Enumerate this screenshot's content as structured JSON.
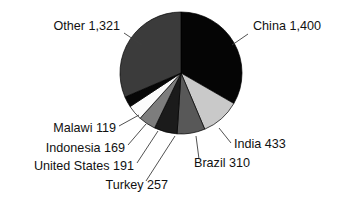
{
  "chart_data": {
    "type": "pie",
    "title": "",
    "subtitle": "",
    "xlabel": "",
    "ylabel": "",
    "legend_position": "none",
    "grid": false,
    "total": 4200,
    "units": "",
    "start_angle_deg": 0,
    "direction": "clockwise",
    "categories": [
      "China",
      "India",
      "Brazil",
      "Turkey",
      "United States",
      "Indonesia",
      "Malawi",
      "Other"
    ],
    "values": [
      1400,
      433,
      310,
      257,
      191,
      169,
      119,
      1321
    ],
    "value_labels": [
      "1,400",
      "433",
      "310",
      "257",
      "191",
      "169",
      "119",
      "1,321"
    ],
    "slices": [
      {
        "name": "China",
        "value": 1400,
        "value_label": "1,400",
        "label": "China 1,400",
        "color": "#050505",
        "start_deg": 0.0,
        "end_deg": 120.0,
        "label_x": 253,
        "label_y": 30,
        "label_anchor": "start",
        "leader_from_x": 248,
        "leader_from_y": 34,
        "leader_to_x": 232,
        "leader_to_y": 45
      },
      {
        "name": "India",
        "value": 433,
        "value_label": "433",
        "label": "India 433",
        "color": "#c9c9c9",
        "start_deg": 120.0,
        "end_deg": 157.1,
        "label_x": 234,
        "label_y": 148,
        "label_anchor": "start",
        "leader_from_x": 231,
        "leader_from_y": 143,
        "leader_to_x": 219,
        "leader_to_y": 128
      },
      {
        "name": "Brazil",
        "value": 310,
        "value_label": "310",
        "label": "Brazil 310",
        "color": "#585858",
        "start_deg": 157.1,
        "end_deg": 183.7,
        "label_x": 194,
        "label_y": 167,
        "label_anchor": "start",
        "leader_from_x": 199,
        "leader_from_y": 159,
        "leader_to_x": 196,
        "leader_to_y": 136
      },
      {
        "name": "Turkey",
        "value": 257,
        "value_label": "257",
        "label": "Turkey 257",
        "color": "#1b1b1b",
        "label_x": 168,
        "label_y": 189,
        "label_anchor": "end",
        "start_deg": 183.7,
        "end_deg": 205.7,
        "leader_from_x": 146,
        "leader_from_y": 181,
        "leader_to_x": 175,
        "leader_to_y": 136
      },
      {
        "name": "United States",
        "value": 191,
        "value_label": "191",
        "label": "United States 191",
        "color": "#7d7d7d",
        "start_deg": 205.7,
        "end_deg": 222.1,
        "label_x": 134,
        "label_y": 170,
        "label_anchor": "end",
        "leader_from_x": 137,
        "leader_from_y": 163,
        "leader_to_x": 158,
        "leader_to_y": 131
      },
      {
        "name": "Indonesia",
        "value": 169,
        "value_label": "169",
        "label": "Indonesia 169",
        "color": "#fbfbfb",
        "start_deg": 222.1,
        "end_deg": 236.6,
        "label_x": 125,
        "label_y": 152,
        "label_anchor": "end",
        "leader_from_x": 128,
        "leader_from_y": 145,
        "leader_to_x": 146,
        "leader_to_y": 124
      },
      {
        "name": "Malawi",
        "value": 119,
        "value_label": "119",
        "label": "Malawi 119",
        "color": "#070707",
        "start_deg": 236.6,
        "end_deg": 246.8,
        "label_x": 116,
        "label_y": 132,
        "label_anchor": "end",
        "leader_from_x": 119,
        "leader_from_y": 126,
        "leader_to_x": 139,
        "leader_to_y": 115
      },
      {
        "name": "Other",
        "value": 1321,
        "value_label": "1,321",
        "label": "Other 1,321",
        "color": "#3b3b3b",
        "start_deg": 246.8,
        "end_deg": 360.0,
        "label_x": 120,
        "label_y": 30,
        "label_anchor": "end",
        "leader_from_x": 124,
        "leader_from_y": 33,
        "leader_to_x": 142,
        "leader_to_y": 45
      }
    ],
    "geometry": {
      "center_x": 181,
      "center_y": 73,
      "radius": 61
    }
  }
}
